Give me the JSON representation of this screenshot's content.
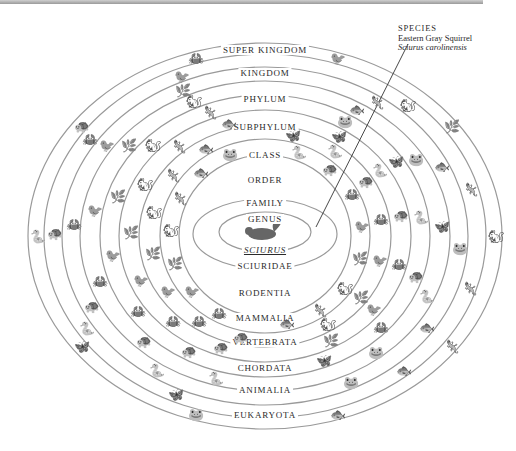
{
  "diagram": {
    "type": "nested-ellipses",
    "species_callout": {
      "heading": "SPECIES",
      "common_name": "Eastern Gray Squirrel",
      "scientific_name": "Sciurus carolinensis"
    },
    "top_labels": [
      {
        "text": "SUPER KINGDOM",
        "y": 45
      },
      {
        "text": "KINGDOM",
        "y": 68
      },
      {
        "text": "PHYLUM",
        "y": 94
      },
      {
        "text": "SUBPHYLUM",
        "y": 122
      },
      {
        "text": "CLASS",
        "y": 150
      },
      {
        "text": "ORDER",
        "y": 175
      },
      {
        "text": "FAMILY",
        "y": 198
      },
      {
        "text": "GENUS",
        "y": 214
      }
    ],
    "bottom_labels": [
      {
        "text": "SCIURUS",
        "y": 245,
        "italic": true
      },
      {
        "text": "SCIURIDAE",
        "y": 261
      },
      {
        "text": "RODENTIA",
        "y": 288
      },
      {
        "text": "MAMMALIA",
        "y": 313
      },
      {
        "text": "VERTEBRATA",
        "y": 337
      },
      {
        "text": "CHORDATA",
        "y": 363
      },
      {
        "text": "ANIMALIA",
        "y": 385
      },
      {
        "text": "EUKARYOTA",
        "y": 410
      }
    ],
    "ring_color": "#9a9a9a",
    "illustration_color": "#555555"
  }
}
